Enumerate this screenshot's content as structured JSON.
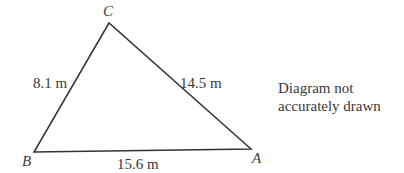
{
  "diagram": {
    "type": "triangle",
    "vertices": [
      {
        "id": "C",
        "label": "C",
        "x": 109,
        "y": 23
      },
      {
        "id": "B",
        "label": "B",
        "x": 34,
        "y": 152
      },
      {
        "id": "A",
        "label": "A",
        "x": 251,
        "y": 149
      }
    ],
    "sides": [
      {
        "from": "B",
        "to": "C",
        "label": "8.1 m"
      },
      {
        "from": "C",
        "to": "A",
        "label": "14.5 m"
      },
      {
        "from": "B",
        "to": "A",
        "label": "15.6 m"
      }
    ],
    "line_color": "#333333"
  },
  "labels": {
    "vertex_c": "C",
    "vertex_b": "B",
    "vertex_a": "A",
    "side_bc": "8.1 m",
    "side_ca": "14.5 m",
    "side_ba": "15.6 m"
  },
  "note": {
    "line1": "Diagram not",
    "line2": "accurately drawn"
  }
}
